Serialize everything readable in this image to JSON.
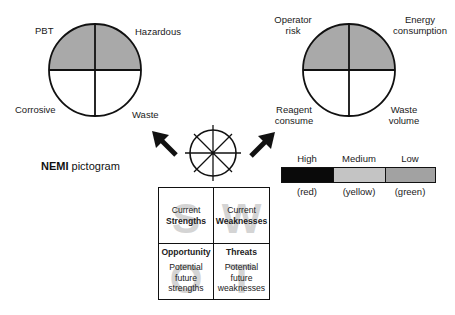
{
  "pictograms": {
    "nemi_circle": {
      "quadrants": [
        {
          "position": "top-left",
          "label": "PBT",
          "filled": true
        },
        {
          "position": "top-right",
          "label": "Hazardous",
          "filled": true
        },
        {
          "position": "bottom-left",
          "label": "Corrosive",
          "filled": false
        },
        {
          "position": "bottom-right",
          "label": "Waste",
          "filled": false
        }
      ]
    },
    "green_circle": {
      "quadrants": [
        {
          "position": "top-left",
          "label_lines": [
            "Operator",
            "risk"
          ],
          "filled": true
        },
        {
          "position": "top-right",
          "label_lines": [
            "Energy",
            "consumption"
          ],
          "filled": true
        },
        {
          "position": "bottom-left",
          "label_lines": [
            "Reagent",
            "consume"
          ],
          "filled": false
        },
        {
          "position": "bottom-right",
          "label_lines": [
            "Waste",
            "volume"
          ],
          "filled": false
        }
      ]
    }
  },
  "center_icon": {
    "name": "segmented-circle",
    "arrows": [
      "up-left",
      "up-right"
    ]
  },
  "nemi_caption": {
    "bold": "NEMI",
    "rest": " pictogram"
  },
  "legend": {
    "items": [
      {
        "level": "High",
        "color_name": "(red)",
        "fill": "#0a0a0a"
      },
      {
        "level": "Medium",
        "color_name": "(yellow)",
        "fill": "#c4c4c4"
      },
      {
        "level": "Low",
        "color_name": "(green)",
        "fill": "#a2a2a2"
      }
    ]
  },
  "colors": {
    "quadrant_fill": "#a9a9a9",
    "stroke": "#111111"
  },
  "swot": {
    "cells": [
      {
        "letter": "S",
        "line1": "Current",
        "line2": "Strengths"
      },
      {
        "letter": "W",
        "line1": "Current",
        "line2": "Weaknesses"
      },
      {
        "letter": "O",
        "title": "Opportunity",
        "lines": [
          "Potential",
          "future",
          "strengths"
        ]
      },
      {
        "letter": "T",
        "title": "Threats",
        "lines": [
          "Potential",
          "future",
          "weaknesses"
        ]
      }
    ]
  }
}
